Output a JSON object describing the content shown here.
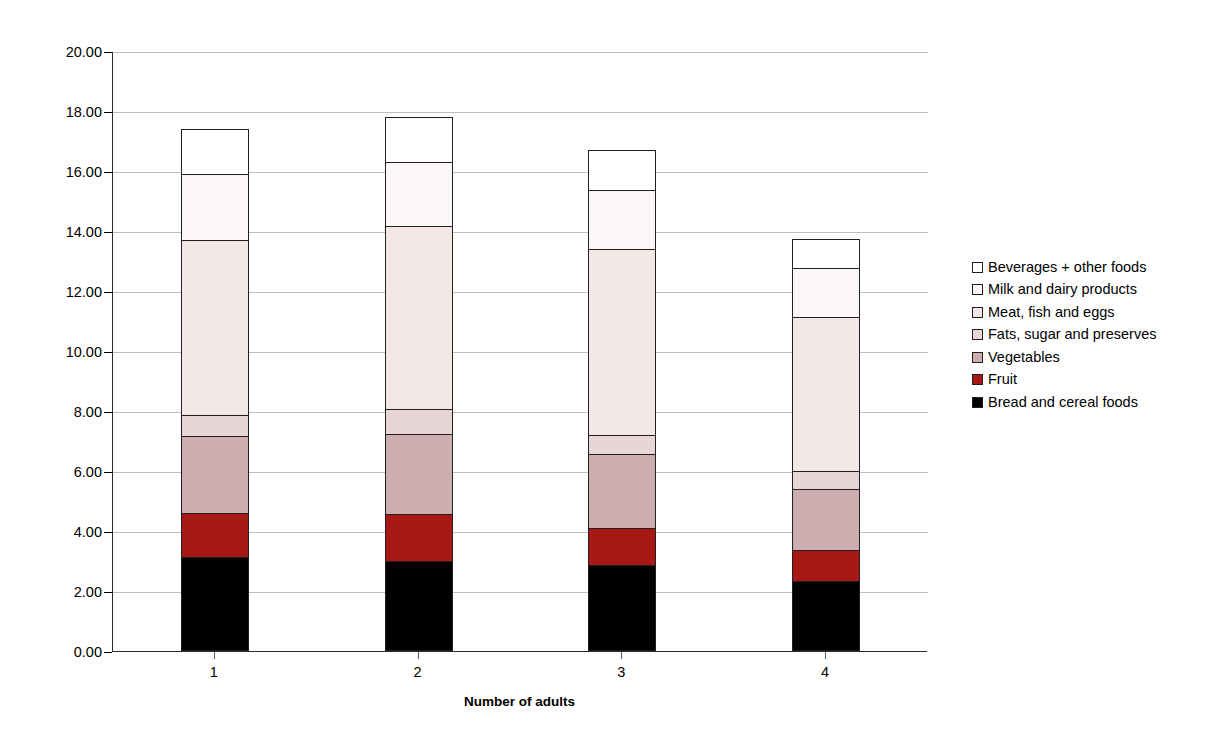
{
  "chart_data": {
    "type": "bar",
    "subtype": "stacked-bar",
    "title": "",
    "xlabel": "Number of adults",
    "ylabel": "",
    "categories": [
      "1",
      "2",
      "3",
      "4"
    ],
    "ylim": [
      0.0,
      20.0
    ],
    "ytick_step": 2.0,
    "ytick_labels": [
      "0.00",
      "2.00",
      "4.00",
      "6.00",
      "8.00",
      "10.00",
      "12.00",
      "14.00",
      "16.00",
      "18.00",
      "20.00"
    ],
    "ytick_values": [
      0,
      2,
      4,
      6,
      8,
      10,
      12,
      14,
      16,
      18,
      20
    ],
    "grid": "horizontal",
    "legend_position": "right",
    "stack_order_bottom_to_top": [
      "Bread and cereal foods",
      "Fruit",
      "Vegetables",
      "Fats, sugar and preserves",
      "Meat, fish and eggs",
      "Milk and dairy products",
      "Beverages + other foods"
    ],
    "series": [
      {
        "name": "Beverages + other foods",
        "color": "#ffffff",
        "values": [
          1.53,
          1.53,
          1.4,
          1.0
        ]
      },
      {
        "name": "Milk and dairy products",
        "color": "#fbf7f8",
        "values": [
          2.27,
          2.2,
          2.0,
          1.7
        ]
      },
      {
        "name": "Meat, fish and eggs",
        "color": "#f4e8e7",
        "values": [
          5.87,
          6.13,
          6.23,
          5.17
        ]
      },
      {
        "name": "Fats, sugar and preserves",
        "color": "#e8d5d5",
        "values": [
          0.73,
          0.87,
          0.67,
          0.63
        ]
      },
      {
        "name": "Vegetables",
        "color": "#cdaeb0",
        "values": [
          2.6,
          2.73,
          2.53,
          2.1
        ]
      },
      {
        "name": "Fruit",
        "color": "#a81916",
        "values": [
          1.53,
          1.6,
          1.27,
          1.07
        ]
      },
      {
        "name": "Bread and cereal foods",
        "color": "#000000",
        "values": [
          3.13,
          3.0,
          2.87,
          2.33
        ]
      }
    ],
    "totals": [
      17.66,
      18.06,
      16.97,
      14.0
    ]
  },
  "legend": {
    "items": [
      {
        "label": "Beverages + other foods",
        "color": "#ffffff"
      },
      {
        "label": "Milk and dairy products",
        "color": "#fbf7f8"
      },
      {
        "label": "Meat, fish and eggs",
        "color": "#f4e8e7"
      },
      {
        "label": "Fats, sugar and preserves",
        "color": "#e8d5d5"
      },
      {
        "label": "Vegetables",
        "color": "#cdaeb0"
      },
      {
        "label": "Fruit",
        "color": "#a81916"
      },
      {
        "label": "Bread and cereal foods",
        "color": "#000000"
      }
    ]
  },
  "axis": {
    "x_title": "Number of adults",
    "gridline_color": "#bfbfbf",
    "axis_color": "#2b2b2b"
  }
}
